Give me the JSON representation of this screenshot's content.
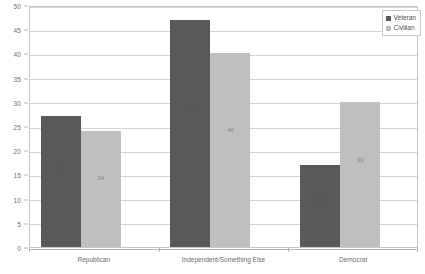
{
  "chart_data": {
    "type": "bar",
    "title": "",
    "subtitle": "",
    "xlabel": "",
    "ylabel": "",
    "categories": [
      "Republican",
      "Independent/Something Else",
      "Democrat"
    ],
    "series": [
      {
        "name": "Veteran",
        "color": "#595959",
        "values": [
          27,
          47,
          17
        ]
      },
      {
        "name": "Civilian",
        "color": "#bfbfbf",
        "values": [
          24,
          40,
          30
        ]
      }
    ],
    "ylim": [
      0,
      50
    ],
    "yticks": [
      0,
      5,
      10,
      15,
      20,
      25,
      30,
      35,
      40,
      45,
      50
    ],
    "ytick_labels": [
      "0",
      "5",
      "10",
      "15",
      "20",
      "25",
      "30",
      "35",
      "40",
      "45",
      "50"
    ],
    "grid": true,
    "grid_axis": "y",
    "legend_position": "top-right",
    "data_labels": [
      {
        "category": "Republican",
        "series": "Veteran",
        "text": "27"
      },
      {
        "category": "Republican",
        "series": "Civilian",
        "text": "24"
      },
      {
        "category": "Independent/Something Else",
        "series": "Veteran",
        "text": "47"
      },
      {
        "category": "Independent/Something Else",
        "series": "Civilian",
        "text": "40"
      },
      {
        "category": "Democrat",
        "series": "Veteran",
        "text": "17"
      },
      {
        "category": "Democrat",
        "series": "Civilian",
        "text": "30"
      }
    ],
    "plot_border_color": "#c6c6c6",
    "gridline_color": "#d4d4d4",
    "background": "#ffffff"
  }
}
